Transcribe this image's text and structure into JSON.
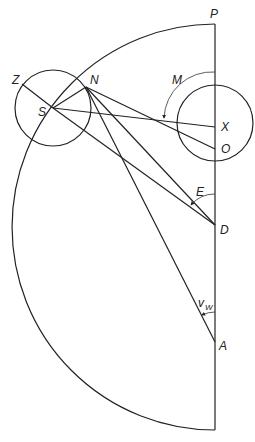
{
  "diagram": {
    "labels": {
      "P": "P",
      "Z": "Z",
      "N": "N",
      "S": "S",
      "M": "M",
      "X": "X",
      "O": "O",
      "E": "E",
      "D": "D",
      "v": "v",
      "w": "W",
      "A": "A"
    },
    "colors": {
      "line": "#222222",
      "background": "#ffffff"
    },
    "points": {
      "P": [
        215,
        24
      ],
      "Z": [
        22,
        62
      ],
      "N": [
        86,
        87
      ],
      "S": [
        53,
        108
      ],
      "X": [
        215,
        127
      ],
      "O": [
        215,
        149
      ],
      "D": [
        215,
        225
      ],
      "A": [
        215,
        342
      ],
      "bottom": [
        215,
        430
      ]
    },
    "angles": [
      "M",
      "E",
      "v_W"
    ]
  }
}
